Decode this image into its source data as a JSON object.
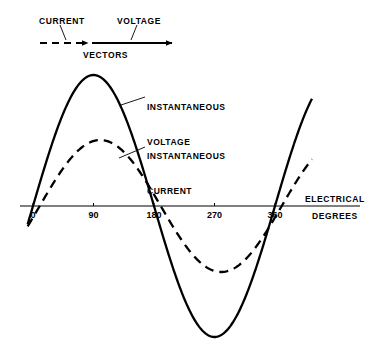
{
  "figure": {
    "background_color": "#ffffff",
    "ink_color": "#000000"
  },
  "vector_diagram": {
    "caption": "VECTORS",
    "current_label": "CURRENT",
    "voltage_label": "VOLTAGE",
    "current_vector": {
      "style": "dashed",
      "x1": 40,
      "x2": 88,
      "y": 43,
      "relative_magnitude": 0.5
    },
    "voltage_vector": {
      "style": "solid",
      "x1": 92,
      "x2": 172,
      "y": 43,
      "relative_magnitude": 1.0
    },
    "current_leader": {
      "x1": 60,
      "y1": 25,
      "x2": 66,
      "y2": 40
    },
    "voltage_leader": {
      "x1": 137,
      "y1": 25,
      "x2": 131,
      "y2": 40
    }
  },
  "callouts": [
    {
      "name": "instantaneous-voltage",
      "line1": "INSTANTANEOUS",
      "line2": "VOLTAGE",
      "text_x": 147,
      "text_y": 79,
      "leader": {
        "x1": 145,
        "y1": 97,
        "x2": 121,
        "y2": 105
      }
    },
    {
      "name": "instantaneous-current",
      "line1": "INSTANTANEOUS",
      "line2": "CURRENT",
      "text_x": 147,
      "text_y": 128,
      "leader": {
        "x1": 145,
        "y1": 147,
        "x2": 119,
        "y2": 158
      }
    }
  ],
  "chart_data": {
    "type": "line",
    "title": "",
    "xlabel_line1": "ELECTRICAL",
    "xlabel_line2": "DEGREES",
    "ylabel": "",
    "xlim": [
      -8,
      415
    ],
    "ylim": [
      -1.08,
      1.08
    ],
    "grid": false,
    "legend_position": "callout-annotations",
    "x_ticks": [
      0,
      90,
      180,
      270,
      360
    ],
    "x_tick_labels": [
      "0",
      "90",
      "180",
      "270",
      "360"
    ],
    "axis_pixels": {
      "baseline_y": 206,
      "x_at_0deg": 33,
      "pixels_per_90deg": 60.5,
      "axis_left": 20,
      "axis_right": 360
    },
    "series": [
      {
        "name": "INSTANTANEOUS VOLTAGE",
        "style": "solid",
        "amplitude": 1.0,
        "phase_deg": 0,
        "peak_amplitude_px": 131,
        "color": "#000000",
        "key_points": [
          {
            "deg": 0,
            "value": 0.0
          },
          {
            "deg": 45,
            "value": 0.71
          },
          {
            "deg": 90,
            "value": 1.0
          },
          {
            "deg": 135,
            "value": 0.71
          },
          {
            "deg": 180,
            "value": 0.0
          },
          {
            "deg": 225,
            "value": -0.71
          },
          {
            "deg": 270,
            "value": -1.0
          },
          {
            "deg": 315,
            "value": -0.71
          },
          {
            "deg": 360,
            "value": 0.0
          },
          {
            "deg": 405,
            "value": 0.71
          },
          {
            "deg": 450,
            "value": 1.0
          }
        ]
      },
      {
        "name": "INSTANTANEOUS CURRENT",
        "style": "dashed",
        "amplitude": 0.5,
        "phase_deg": -10,
        "peak_amplitude_px": 66,
        "color": "#000000",
        "key_points": [
          {
            "deg": 10,
            "value": 0.0
          },
          {
            "deg": 55,
            "value": 0.35
          },
          {
            "deg": 100,
            "value": 0.5
          },
          {
            "deg": 145,
            "value": 0.35
          },
          {
            "deg": 190,
            "value": 0.0
          },
          {
            "deg": 235,
            "value": -0.35
          },
          {
            "deg": 280,
            "value": -0.5
          },
          {
            "deg": 325,
            "value": -0.35
          },
          {
            "deg": 370,
            "value": 0.0
          },
          {
            "deg": 415,
            "value": 0.35
          }
        ]
      }
    ],
    "annotations": [
      "Current lags voltage",
      "Current amplitude is half of voltage amplitude"
    ]
  }
}
